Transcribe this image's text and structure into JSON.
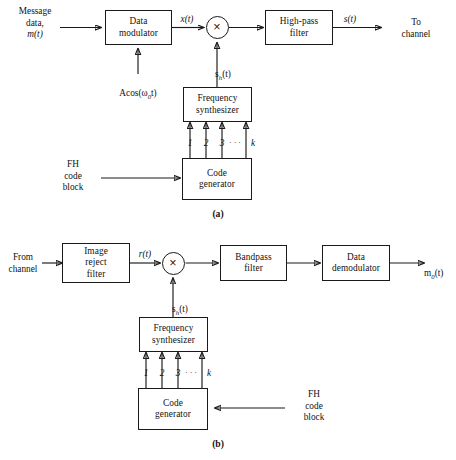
{
  "figure": {
    "type": "block-diagram",
    "background_color": "#ffffff",
    "line_color": "#1a1a1a"
  },
  "panel_a": {
    "caption": "(a)",
    "blocks": {
      "data_modulator": "Data\nmodulator",
      "multiplier": "×",
      "highpass_filter": "High-pass\nfilter",
      "frequency_synthesizer": "Frequency\nsynthesizer",
      "code_generator": "Code\ngenerator"
    },
    "labels": {
      "input_source": "Message\ndata,",
      "input_signal": "m(t)",
      "carrier": "Acos(ω0t)",
      "carrier_amplitude": "A",
      "carrier_fn": "cos(",
      "carrier_omega": "ω",
      "carrier_sub": "0",
      "carrier_tail": "t)",
      "x_signal": "x(t)",
      "s_signal": "s(t)",
      "hop_signal_base": "s",
      "hop_signal_sub": "h",
      "hop_signal_tail": "(t)",
      "output_destination": "To\nchannel",
      "fh_code_block": "FH\ncode\nblock"
    },
    "synth_inputs": [
      "1",
      "2",
      "3",
      "· · ·",
      "k"
    ],
    "synth_input_count": 4
  },
  "panel_b": {
    "caption": "(b)",
    "blocks": {
      "image_reject_filter": "Image\nreject\nfilter",
      "multiplier": "×",
      "bandpass_filter": "Bandpass\nfilter",
      "data_demodulator": "Data\ndemodulator",
      "frequency_synthesizer": "Frequency\nsynthesizer",
      "code_generator": "Code\ngenerator"
    },
    "labels": {
      "input_source": "From\nchannel",
      "r_signal": "r(t)",
      "hop_signal_base": "s",
      "hop_signal_sub": "h",
      "hop_signal_tail": "(t)",
      "output_base": "m",
      "output_sub": "0",
      "output_tail": "(t)",
      "fh_code_block": "FH\ncode\nblock"
    },
    "synth_inputs": [
      "1",
      "2",
      "3",
      "· · ·",
      "k"
    ],
    "synth_input_count": 4
  }
}
